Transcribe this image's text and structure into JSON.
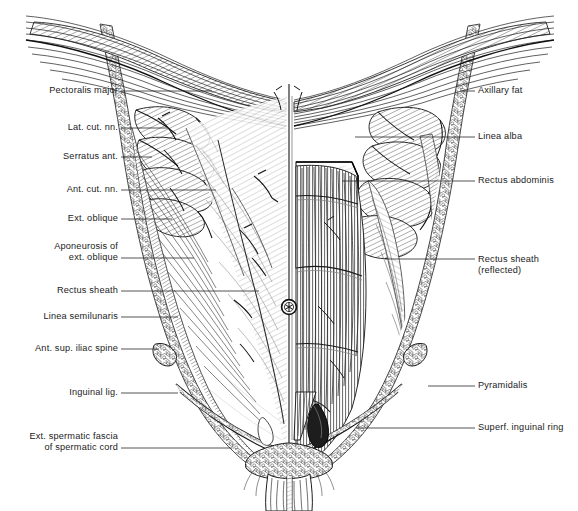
{
  "figure": {
    "view": "anterior",
    "style": "line engraving / hatched pen-and-ink anatomical plate",
    "background_color": "#ffffff",
    "ink_color": "#1b1b1b",
    "leader_color": "#2a2a2a",
    "canvas": {
      "width": 578,
      "height": 511
    }
  },
  "labels_left": [
    {
      "id": "pectoralis-major",
      "text": "Pectoralis major",
      "lines": [
        "Pectoralis major"
      ],
      "text_x": 118,
      "text_y": 91,
      "leader_x1": 121,
      "leader_y1": 91,
      "leader_x2": 212,
      "leader_y2": 91
    },
    {
      "id": "lat-cut-nn",
      "text": "Lat. cut. nn.",
      "lines": [
        "Lat. cut. nn."
      ],
      "text_x": 118,
      "text_y": 128,
      "leader_x1": 121,
      "leader_y1": 128,
      "leader_x2": 168,
      "leader_y2": 128
    },
    {
      "id": "serratus-ant",
      "text": "Serratus ant.",
      "lines": [
        "Serratus ant."
      ],
      "text_x": 118,
      "text_y": 157,
      "leader_x1": 121,
      "leader_y1": 157,
      "leader_x2": 152,
      "leader_y2": 157
    },
    {
      "id": "ant-cut-nn",
      "text": "Ant. cut. nn.",
      "lines": [
        "Ant. cut. nn."
      ],
      "text_x": 118,
      "text_y": 190,
      "leader_x1": 121,
      "leader_y1": 190,
      "leader_x2": 216,
      "leader_y2": 190
    },
    {
      "id": "ext-oblique",
      "text": "Ext. oblique",
      "lines": [
        "Ext. oblique"
      ],
      "text_x": 118,
      "text_y": 219,
      "leader_x1": 121,
      "leader_y1": 219,
      "leader_x2": 172,
      "leader_y2": 219
    },
    {
      "id": "aponeurosis-ext-oblique",
      "text": "Aponeurosis of ext. oblique",
      "lines": [
        "Aponeurosis of",
        "ext. oblique"
      ],
      "text_x": 118,
      "text_y": 252,
      "leader_x1": 121,
      "leader_y1": 258,
      "leader_x2": 194,
      "leader_y2": 258
    },
    {
      "id": "rectus-sheath-left",
      "text": "Rectus sheath",
      "lines": [
        "Rectus sheath"
      ],
      "text_x": 118,
      "text_y": 291,
      "leader_x1": 121,
      "leader_y1": 291,
      "leader_x2": 259,
      "leader_y2": 291
    },
    {
      "id": "linea-semilunaris",
      "text": "Linea semilunaris",
      "lines": [
        "Linea semilunaris"
      ],
      "text_x": 118,
      "text_y": 317,
      "leader_x1": 121,
      "leader_y1": 317,
      "leader_x2": 178,
      "leader_y2": 317
    },
    {
      "id": "ant-sup-iliac-spine",
      "text": "Ant. sup. iliac spine",
      "lines": [
        "Ant. sup. iliac spine"
      ],
      "text_x": 118,
      "text_y": 349,
      "leader_x1": 121,
      "leader_y1": 349,
      "leader_x2": 159,
      "leader_y2": 349
    },
    {
      "id": "inguinal-lig",
      "text": "Inguinal lig.",
      "lines": [
        "Inguinal lig."
      ],
      "text_x": 118,
      "text_y": 393,
      "leader_x1": 121,
      "leader_y1": 393,
      "leader_x2": 178,
      "leader_y2": 393
    },
    {
      "id": "ext-spermatic-fascia",
      "text": "Ext. spermatic fascia of spermatic cord",
      "lines": [
        "Ext. spermatic fascia",
        "of spermatic cord"
      ],
      "text_x": 118,
      "text_y": 442,
      "leader_x1": 121,
      "leader_y1": 448,
      "leader_x2": 232,
      "leader_y2": 448
    }
  ],
  "labels_right": [
    {
      "id": "axillary-fat",
      "text": "Axillary fat",
      "lines": [
        "Axillary fat"
      ],
      "text_x": 478,
      "text_y": 91,
      "leader_x1": 460,
      "leader_y1": 91,
      "leader_x2": 475,
      "leader_y2": 91
    },
    {
      "id": "linea-alba",
      "text": "Linea alba",
      "lines": [
        "Linea alba"
      ],
      "text_x": 478,
      "text_y": 137,
      "leader_x1": 355,
      "leader_y1": 137,
      "leader_x2": 475,
      "leader_y2": 137
    },
    {
      "id": "rectus-abdominis",
      "text": "Rectus abdominis",
      "lines": [
        "Rectus abdominis"
      ],
      "text_x": 478,
      "text_y": 181,
      "leader_x1": 342,
      "leader_y1": 181,
      "leader_x2": 475,
      "leader_y2": 181
    },
    {
      "id": "rectus-sheath-reflected",
      "text": "Rectus sheath (reflected)",
      "lines": [
        "Rectus sheath",
        "(reflected)"
      ],
      "text_x": 478,
      "text_y": 265,
      "leader_x1": 385,
      "leader_y1": 259,
      "leader_x2": 475,
      "leader_y2": 259
    },
    {
      "id": "pyramidalis",
      "text": "Pyramidalis",
      "lines": [
        "Pyramidalis"
      ],
      "text_x": 478,
      "text_y": 386,
      "leader_x1": 428,
      "leader_y1": 386,
      "leader_x2": 475,
      "leader_y2": 386
    },
    {
      "id": "superf-inguinal-ring",
      "text": "Superf. inguinal ring",
      "lines": [
        "Superf. inguinal ring"
      ],
      "text_x": 478,
      "text_y": 428,
      "leader_x1": 356,
      "leader_y1": 428,
      "leader_x2": 475,
      "leader_y2": 428
    }
  ],
  "structures": [
    {
      "id": "umbilicus",
      "name": "umbilicus",
      "cx": 289,
      "cy": 307,
      "r": 7
    },
    {
      "id": "midline",
      "name": "linea alba midline",
      "x": 289
    },
    {
      "id": "spermatic-cord",
      "name": "spermatic cord",
      "cx": 289,
      "cy": 480
    }
  ],
  "caption": ""
}
